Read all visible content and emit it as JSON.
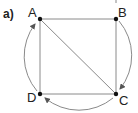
{
  "figure": {
    "part_label": "a)",
    "colors": {
      "line": "#8a8a8a",
      "arc": "#8a8a8a",
      "point": "#111111",
      "text": "#222222",
      "background": "#ffffff"
    },
    "vertices": [
      {
        "id": "A",
        "label": "A",
        "x": 40,
        "y": 19
      },
      {
        "id": "B",
        "label": "B",
        "x": 116,
        "y": 19
      },
      {
        "id": "C",
        "label": "C",
        "x": 116,
        "y": 94
      },
      {
        "id": "D",
        "label": "D",
        "x": 40,
        "y": 94
      }
    ],
    "segments": [
      {
        "from": "A",
        "to": "B"
      },
      {
        "from": "B",
        "to": "C"
      },
      {
        "from": "C",
        "to": "D"
      },
      {
        "from": "D",
        "to": "A"
      },
      {
        "from": "A",
        "to": "C",
        "kind": "diagonal"
      }
    ],
    "directed_arcs": [
      {
        "from": "B",
        "to": "C",
        "side": "right"
      },
      {
        "from": "C",
        "to": "D",
        "side": "bottom"
      },
      {
        "from": "D",
        "to": "A",
        "side": "left"
      }
    ]
  }
}
